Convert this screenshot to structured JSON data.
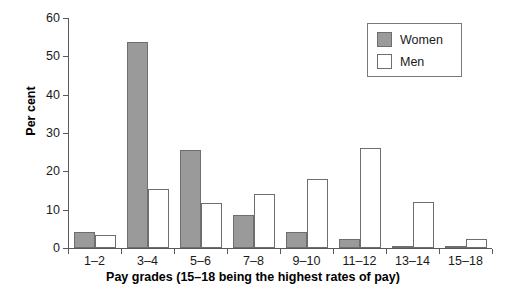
{
  "chart_data": {
    "type": "bar",
    "title": "",
    "xlabel": "Pay grades (15–18 being the highest rates of pay)",
    "ylabel": "Per cent",
    "categories": [
      "1–2",
      "3–4",
      "5–6",
      "7–8",
      "9–10",
      "11–12",
      "13–14",
      "15–18"
    ],
    "series": [
      {
        "name": "Women",
        "color": "#9a9a9a",
        "values": [
          4.3,
          53.7,
          25.6,
          8.5,
          4.1,
          2.4,
          0.6,
          0.6
        ]
      },
      {
        "name": "Men",
        "color": "#ffffff",
        "values": [
          3.4,
          15.4,
          11.8,
          14.2,
          17.9,
          26.2,
          12.1,
          2.4
        ]
      }
    ],
    "ylim": [
      0,
      60
    ],
    "yticks": [
      0,
      10,
      20,
      30,
      40,
      50,
      60
    ],
    "ytick_labels": [
      "0",
      "10",
      "20",
      "30",
      "40",
      "50",
      "60"
    ],
    "grid": false,
    "legend_position": "top-right",
    "legend_entries": [
      "Women",
      "Men"
    ]
  },
  "axes": {
    "y_axis_title": "Per cent",
    "x_axis_title": "Pay grades (15–18 being the highest rates of pay)"
  },
  "legend": {
    "items": [
      {
        "label": "Women"
      },
      {
        "label": "Men"
      }
    ]
  },
  "colors": {
    "women_fill": "#9a9a9a",
    "men_fill": "#ffffff",
    "bar_outline": "#6e6e6e",
    "axis": "#595959",
    "text": "#1a1a1a",
    "background": "#ffffff"
  }
}
